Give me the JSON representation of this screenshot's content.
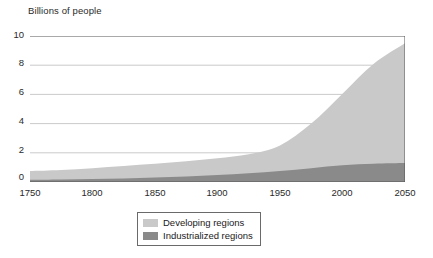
{
  "chart_data": {
    "type": "area",
    "stacked": true,
    "title": "Billions of people",
    "xlabel": "",
    "ylabel": "Billions of people",
    "xlim": [
      1750,
      2050
    ],
    "ylim": [
      0,
      10
    ],
    "xticks": [
      1750,
      1800,
      1850,
      1900,
      1950,
      2000,
      2050
    ],
    "yticks": [
      0,
      2,
      4,
      6,
      8,
      10
    ],
    "grid": "horizontal",
    "legend_position": "bottom-center",
    "x": [
      1750,
      1775,
      1800,
      1825,
      1850,
      1875,
      1900,
      1925,
      1950,
      1975,
      2000,
      2025,
      2050
    ],
    "series": [
      {
        "name": "Industrialized regions",
        "color": "#8a8a8a",
        "values": [
          0.15,
          0.17,
          0.2,
          0.24,
          0.3,
          0.37,
          0.48,
          0.6,
          0.75,
          0.95,
          1.15,
          1.25,
          1.3
        ]
      },
      {
        "name": "Developing regions",
        "color": "#c9c9c9",
        "values": [
          0.6,
          0.65,
          0.75,
          0.86,
          0.95,
          1.05,
          1.15,
          1.3,
          1.75,
          3.05,
          4.9,
          6.85,
          8.2
        ]
      }
    ],
    "totals": [
      0.75,
      0.82,
      0.95,
      1.1,
      1.25,
      1.42,
      1.63,
      1.9,
      2.5,
      4.0,
      6.05,
      8.1,
      9.5
    ],
    "annotations": []
  },
  "legend": {
    "items": [
      {
        "label": "Developing regions",
        "color": "#c9c9c9"
      },
      {
        "label": "Industrialized regions",
        "color": "#8a8a8a"
      }
    ]
  },
  "axis": {
    "y_labels": [
      "10",
      "8",
      "6",
      "4",
      "2",
      "0"
    ],
    "x_labels": [
      "1750",
      "1800",
      "1850",
      "1900",
      "1950",
      "2000",
      "2050"
    ]
  },
  "style": {
    "grid_color": "#bdbdbd",
    "axis_color": "#555555",
    "background": "#ffffff"
  }
}
